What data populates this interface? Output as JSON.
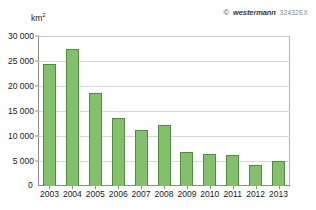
{
  "credit": {
    "copyright_symbol": "©",
    "brand": "westermann",
    "code": "32432EX"
  },
  "chart_data": {
    "type": "bar",
    "title": "",
    "subtitle": "",
    "xlabel": "",
    "ylabel": "km²",
    "ylabel_base": "km",
    "ylabel_exponent": "2",
    "categories": [
      "2003",
      "2004",
      "2005",
      "2006",
      "2007",
      "2008",
      "2009",
      "2010",
      "2011",
      "2012",
      "2013"
    ],
    "values": [
      24400,
      27400,
      18700,
      13700,
      11300,
      12200,
      6800,
      6400,
      6200,
      4300,
      5000
    ],
    "ylim": [
      0,
      30000
    ],
    "yticks": [
      0,
      5000,
      10000,
      15000,
      20000,
      25000,
      30000
    ],
    "ytick_labels": [
      "0",
      "5 000",
      "10 000",
      "15 000",
      "20 000",
      "25 000",
      "30 000"
    ],
    "grid": true,
    "legend": "none",
    "legend_position": "none",
    "series": [
      {
        "name": "",
        "values": [
          24400,
          27400,
          18700,
          13700,
          11300,
          12200,
          6800,
          6400,
          6200,
          4300,
          5000
        ]
      }
    ],
    "colors": {
      "bar_fill": "#84c06c",
      "bar_stroke": "#4f8f42",
      "gridline": "#d7d7d7",
      "axis": "#8d8d8d",
      "text": "#1a1a1a",
      "credit_text": "#3a3a3a",
      "credit_code": "#8a8a8a",
      "background": "#ffffff"
    }
  }
}
